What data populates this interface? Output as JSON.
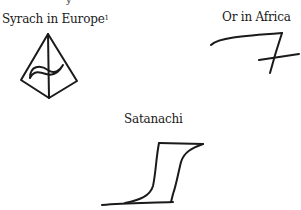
{
  "page": {
    "top_fragment": "y"
  },
  "figures": [
    {
      "caption": "Syrach in Europe",
      "footnote_marker": "1",
      "symbol": "pyramid-with-wave-symbol"
    },
    {
      "caption": "Or in Africa",
      "symbol": "crossed-seven-symbol"
    },
    {
      "caption": "Satanachi",
      "symbol": "hooked-step-symbol"
    }
  ],
  "colors": {
    "ink": "#1a1a1a",
    "background": "#ffffff"
  }
}
